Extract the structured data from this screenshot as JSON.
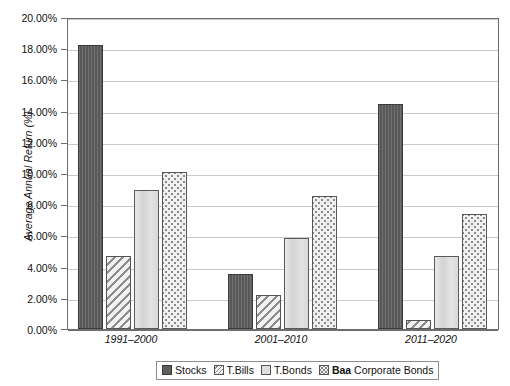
{
  "chart_data": {
    "type": "bar",
    "title": "",
    "xlabel": "",
    "ylabel": "Average Annual Return (%)",
    "ylim": [
      0,
      20
    ],
    "ytick_step": 2,
    "grid": true,
    "legend_position": "bottom",
    "categories": [
      "1991–2000",
      "2001–2010",
      "2011–2020"
    ],
    "series": [
      {
        "name": "Stocks",
        "key": "stocks",
        "pattern": "solid-dark-gray",
        "values": [
          18.2,
          3.55,
          14.4
        ]
      },
      {
        "name": "T.Bills",
        "key": "tbills",
        "pattern": "diagonal-hatch",
        "values": [
          4.65,
          2.15,
          0.6
        ]
      },
      {
        "name": "T.Bonds",
        "key": "tbonds",
        "pattern": "solid-light-gray",
        "values": [
          8.9,
          5.85,
          4.7
        ]
      },
      {
        "name": "Baa Corporate Bonds",
        "key": "baa",
        "pattern": "dotted-stipple",
        "values": [
          10.05,
          8.5,
          7.4
        ]
      }
    ],
    "ytick_labels": [
      "0.00%",
      "2.00%",
      "4.00%",
      "6.00%",
      "8.00%",
      "10.00%",
      "12.00%",
      "14.00%",
      "16.00%",
      "18.00%",
      "20.00%"
    ],
    "ytick_values": [
      0,
      2,
      4,
      6,
      8,
      10,
      12,
      14,
      16,
      18,
      20
    ]
  },
  "axes": {
    "y_title": "Average Annual Return (%)"
  },
  "legend": {
    "entries": [
      {
        "label": "Stocks",
        "bold_prefix": ""
      },
      {
        "label": "T.Bills",
        "bold_prefix": ""
      },
      {
        "label": "T.Bonds",
        "bold_prefix": ""
      },
      {
        "label": " Corporate Bonds",
        "bold_prefix": "Baa"
      }
    ]
  },
  "colors": {
    "stocks": "#5d5d5d",
    "tbills": "#ededed",
    "tbonds": "#dedede",
    "baa": "#f0f0f0",
    "gridline": "#c9c9c9",
    "axis": "#6e6e6e",
    "text": "#111111",
    "background": "#ffffff"
  }
}
